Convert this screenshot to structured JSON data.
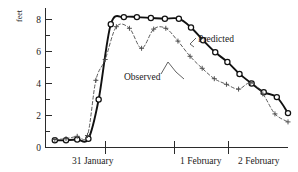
{
  "figure": {
    "background_color": "#ffffff",
    "ink_color": "#111111"
  },
  "axes": {
    "y_title": "feet",
    "y_ticks": [
      "0",
      "2",
      "4",
      "6",
      "8"
    ],
    "x_ticks": [
      "31 January",
      "1 February",
      "2 February"
    ]
  },
  "labels": {
    "predicted": "Predicted",
    "observed": "Observed"
  },
  "chart_data": {
    "type": "line",
    "title": "",
    "subtitle": "",
    "xlabel": "",
    "ylabel": "feet",
    "ylim": [
      0,
      8.6
    ],
    "xlim": [
      0,
      26
    ],
    "grid": false,
    "legend": "inline-annotation",
    "y_tick_values": [
      0,
      2,
      4,
      6,
      8
    ],
    "y_minor_tick_values": [
      1,
      3,
      5,
      7
    ],
    "x_tick_labels": [
      "31 January",
      "1 February",
      "2 February"
    ],
    "x_tick_values": [
      4,
      15,
      24
    ],
    "x_unit": "hours (approx, 1 unit ~ 1 hour)",
    "series": [
      {
        "name": "Predicted",
        "style": "solid",
        "marker": "circle",
        "color": "#111111",
        "x": [
          1.0,
          2.2,
          3.4,
          4.6,
          5.7,
          7.0,
          8.4,
          9.8,
          11.3,
          12.8,
          14.3,
          15.6,
          16.9,
          18.2,
          19.5,
          20.8,
          22.1,
          23.4,
          24.8,
          26.0
        ],
        "y": [
          0.45,
          0.45,
          0.5,
          0.55,
          3.0,
          7.7,
          8.15,
          8.15,
          8.1,
          8.05,
          8.05,
          7.5,
          6.7,
          5.95,
          5.35,
          4.6,
          4.0,
          3.45,
          3.15,
          2.15
        ]
      },
      {
        "name": "Observed",
        "style": "dashed",
        "marker": "plus",
        "color": "#4a4a4a",
        "x": [
          1.0,
          2.2,
          3.4,
          4.5,
          5.4,
          6.4,
          7.6,
          9.0,
          10.3,
          11.6,
          12.9,
          14.2,
          15.5,
          16.8,
          18.1,
          19.4,
          20.7,
          22.0,
          23.3,
          24.6,
          26.0
        ],
        "y": [
          0.5,
          0.55,
          0.7,
          0.75,
          4.2,
          5.5,
          7.55,
          7.45,
          6.2,
          7.4,
          7.45,
          6.65,
          5.7,
          4.95,
          4.3,
          3.95,
          3.65,
          4.05,
          3.35,
          2.1,
          1.6
        ]
      }
    ],
    "annotations": [
      {
        "text": "Predicted",
        "x": 20.2,
        "y": 6.55,
        "leader_to": [
          18.7,
          5.8
        ]
      },
      {
        "text": "Observed",
        "x": 9.6,
        "y": 3.9,
        "leader_to": [
          13.6,
          5.05
        ]
      }
    ]
  }
}
